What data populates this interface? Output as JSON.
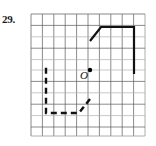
{
  "figure": {
    "problem_number": "29.",
    "origin_label": "O",
    "type": "geometry-rotation-grid",
    "colors": {
      "grid_line": "#5a5a5a",
      "grid_line_light": "#b9b9b9",
      "shape_stroke": "#111111",
      "background": "#ffffff",
      "point_fill": "#000000"
    },
    "grid": {
      "x0": 31,
      "y0": 14,
      "x1": 145,
      "y1": 136,
      "cell": 11.4,
      "cols": 10,
      "rows": 10.7,
      "stroke_width": 0.7
    },
    "center_point": {
      "x": 90,
      "y": 70,
      "r": 2.2,
      "label": "O",
      "label_x": 80,
      "label_y": 78
    },
    "shapes": [
      {
        "name": "preimage-quadrilateral",
        "style": "solid",
        "stroke_width": 2.2,
        "points": "90,41 101,27 134,27 134,74"
      },
      {
        "name": "image-quadrilateral",
        "style": "dashed",
        "stroke_width": 2.4,
        "dash": "6 4",
        "points": "90,99 79,113 46,113 46,66"
      }
    ]
  }
}
